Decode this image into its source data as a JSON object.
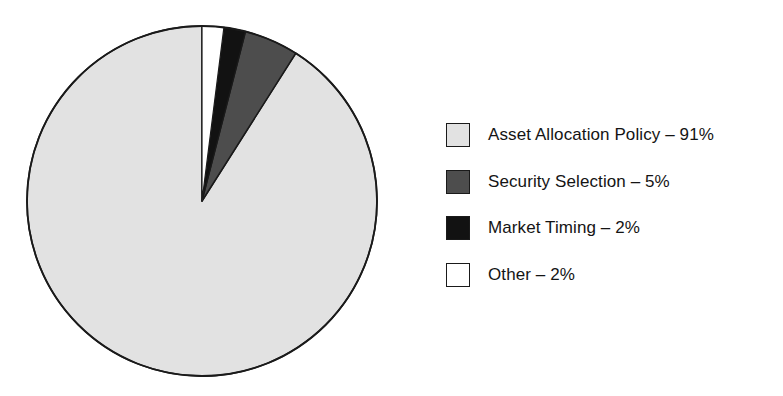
{
  "chart_data": {
    "type": "pie",
    "title": "",
    "subtitle": "",
    "xlabel": "",
    "ylabel": "",
    "grid": false,
    "legend_position": "right",
    "start_angle_deg": 90,
    "direction": "counterclockwise",
    "unit": "%",
    "categories": [
      "Asset Allocation Policy",
      "Security Selection",
      "Market Timing",
      "Other"
    ],
    "values": [
      91,
      5,
      2,
      2
    ],
    "slices": [
      {
        "label": "Asset Allocation Policy",
        "value": 91,
        "value_text": "91%",
        "color": "#e2e2e2",
        "legend_text": "Asset Allocation Policy – 91%"
      },
      {
        "label": "Security Selection",
        "value": 5,
        "value_text": "5%",
        "color": "#4d4d4d",
        "legend_text": "Security Selection – 5%"
      },
      {
        "label": "Market Timing",
        "value": 2,
        "value_text": "2%",
        "color": "#121212",
        "legend_text": "Market Timing – 2%"
      },
      {
        "label": "Other",
        "value": 2,
        "value_text": "2%",
        "color": "#ffffff",
        "legend_text": "Other – 2%"
      }
    ]
  },
  "colors": {
    "background": "#ffffff",
    "outline": "#1a1a1a",
    "text": "#141414",
    "slice_light_gray": "#e2e2e2",
    "slice_dark_gray": "#4d4d4d",
    "slice_black": "#121212",
    "slice_white": "#ffffff"
  },
  "legend": {
    "items": [
      {
        "swatch_name": "legend-swatch-asset-allocation-policy",
        "text": "Asset Allocation Policy – 91%"
      },
      {
        "swatch_name": "legend-swatch-security-selection",
        "text": "Security Selection – 5%"
      },
      {
        "swatch_name": "legend-swatch-market-timing",
        "text": "Market Timing – 2%"
      },
      {
        "swatch_name": "legend-swatch-other",
        "text": "Other – 2%"
      }
    ]
  }
}
